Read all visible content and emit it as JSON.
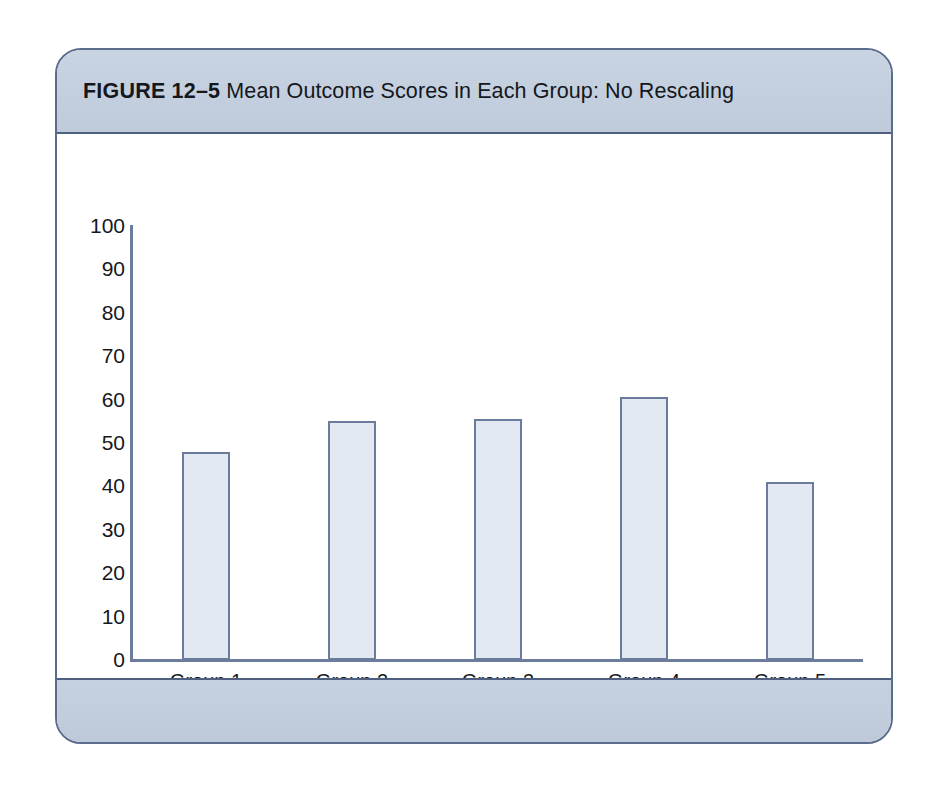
{
  "figure": {
    "number_label": "FIGURE 12–5",
    "title_text": "Mean Outcome Scores in Each Group: No Rescaling",
    "frame_border_color": "#5a6b8c",
    "band_color": "#c3cfde"
  },
  "chart_data": {
    "type": "bar",
    "title": "Mean Outcome Scores in Each Group: No Rescaling",
    "categories": [
      "Group 1",
      "Group 2",
      "Group 3",
      "Group 4",
      "Group 5"
    ],
    "values": [
      48,
      55,
      55.5,
      60.5,
      41
    ],
    "series": [
      {
        "name": "Mean Outcome Score",
        "values": [
          48,
          55,
          55.5,
          60.5,
          41
        ]
      }
    ],
    "xlabel": "",
    "ylabel": "",
    "ylim": [
      0,
      100
    ],
    "yticks": [
      0,
      10,
      20,
      30,
      40,
      50,
      60,
      70,
      80,
      90,
      100
    ],
    "ytick_labels": [
      "0",
      "10",
      "20",
      "30",
      "40",
      "50",
      "60",
      "70",
      "80",
      "90",
      "100"
    ],
    "grid": false,
    "legend": false,
    "bar_fill_color": "#e3e9f2",
    "bar_border_color": "#6a7b9b",
    "axis_color": "#6c7d9c"
  }
}
